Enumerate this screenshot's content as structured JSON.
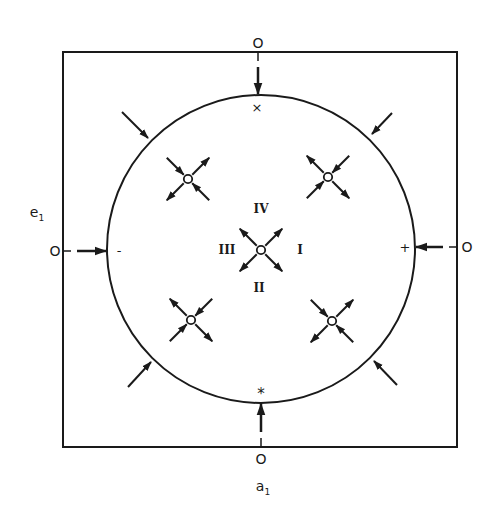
{
  "figure": {
    "stroke_color": "#1a1a1a",
    "background": "#ffffff",
    "box": {
      "x1": 63,
      "y1": 52,
      "x2": 457,
      "y2": 447
    },
    "circle": {
      "cx": 261,
      "cy": 249,
      "r": 154
    },
    "axes": {
      "x_label": "a",
      "x_label_sub": "1",
      "y_label": "e",
      "y_label_sub": "1"
    },
    "edge_points": {
      "top": {
        "label": "O",
        "marker": "×"
      },
      "bottom": {
        "label": "O",
        "marker": "*"
      },
      "left": {
        "label": "O",
        "marker": "-"
      },
      "right": {
        "label": "O",
        "marker": "+"
      }
    },
    "regions": {
      "I": "I",
      "II": "II",
      "III": "III",
      "IV": "IV"
    },
    "nodes": [
      {
        "id": "center",
        "x": 261,
        "y": 250,
        "type": "source",
        "in": [],
        "out": [
          "NE",
          "NW",
          "SE",
          "SW"
        ]
      },
      {
        "id": "upper-left",
        "x": 188,
        "y": 179,
        "type": "saddle",
        "in": [
          "NW",
          "SE"
        ],
        "out": [
          "NE",
          "SW"
        ]
      },
      {
        "id": "upper-right",
        "x": 328,
        "y": 177,
        "type": "saddle",
        "in": [
          "NE",
          "SW"
        ],
        "out": [
          "NW",
          "SE"
        ]
      },
      {
        "id": "lower-left",
        "x": 191,
        "y": 320,
        "type": "saddle",
        "in": [
          "NE",
          "SW"
        ],
        "out": [
          "NW",
          "SE"
        ]
      },
      {
        "id": "lower-right",
        "x": 332,
        "y": 321,
        "type": "saddle",
        "in": [
          "NW",
          "SE"
        ],
        "out": [
          "NE",
          "SW"
        ]
      }
    ],
    "outer_arrows": [
      {
        "id": "nw",
        "from": [
          122,
          112
        ],
        "to": [
          148,
          138
        ]
      },
      {
        "id": "ne",
        "from": [
          392,
          113
        ],
        "to": [
          372,
          134
        ]
      },
      {
        "id": "sw",
        "from": [
          128,
          387
        ],
        "to": [
          151,
          362
        ]
      },
      {
        "id": "se",
        "from": [
          397,
          385
        ],
        "to": [
          374,
          361
        ]
      }
    ]
  }
}
